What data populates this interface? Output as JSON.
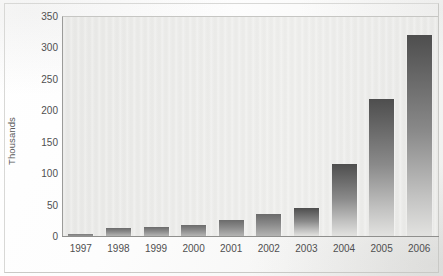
{
  "chart_data": {
    "type": "bar",
    "title": "",
    "subtitle": "",
    "xlabel": "",
    "ylabel": "Thousands",
    "categories": [
      "1997",
      "1998",
      "1999",
      "2000",
      "2001",
      "2002",
      "2003",
      "2004",
      "2005",
      "2006"
    ],
    "values": [
      3,
      13,
      14,
      18,
      25,
      35,
      45,
      115,
      218,
      320
    ],
    "ylim": [
      0,
      350
    ],
    "ytick_labels": [
      "0",
      "50",
      "100",
      "150",
      "200",
      "250",
      "300",
      "350"
    ],
    "ytick_values": [
      0,
      50,
      100,
      150,
      200,
      250,
      300,
      350
    ],
    "grid": false,
    "legend": false,
    "legend_position": "none",
    "series": [
      {
        "name": "",
        "values": [
          3,
          13,
          14,
          18,
          25,
          35,
          45,
          115,
          218,
          320
        ]
      }
    ],
    "colors": {
      "bar_top": "#4e4e4e",
      "bar_bottom": "#e2e2e0",
      "plot_background": "#ececea",
      "axis": "#8f8f8d",
      "text": "#4f4f50"
    }
  }
}
